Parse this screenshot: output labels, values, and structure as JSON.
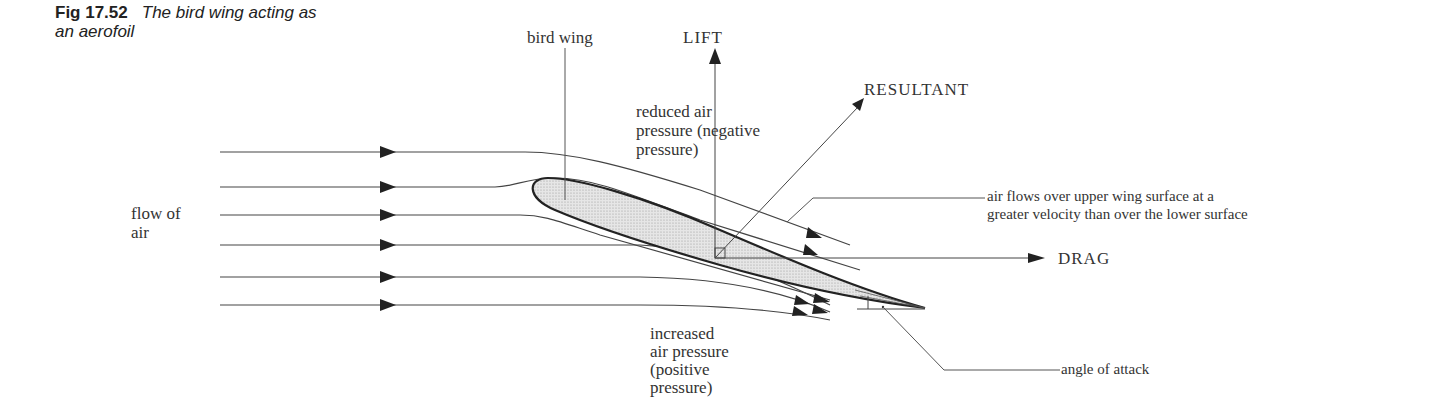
{
  "figure": {
    "number": "Fig 17.52",
    "title_line1": "The bird wing acting as",
    "title_line2": "an aerofoil"
  },
  "labels": {
    "bird_wing": "bird wing",
    "lift": "LIFT",
    "resultant": "RESULTANT",
    "drag": "DRAG",
    "reduced_pressure": [
      "reduced air",
      "pressure (negative",
      "pressure)"
    ],
    "flow_of_air": [
      "flow of",
      "air"
    ],
    "upper_surface_note": [
      "air flows over upper wing surface at a",
      "greater velocity than over the lower surface"
    ],
    "increased_pressure": [
      "increased",
      "air pressure",
      "(positive",
      "pressure)"
    ],
    "angle_of_attack": "angle of attack"
  },
  "colors": {
    "line": "#333333",
    "wing_fill": "#dcdcdc",
    "text": "#333333"
  }
}
